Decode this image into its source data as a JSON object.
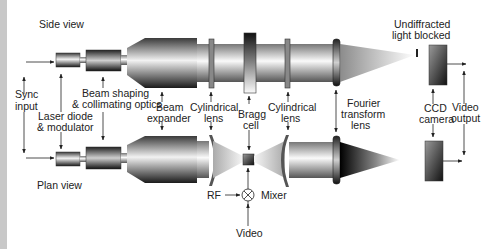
{
  "views": {
    "side": "Side view",
    "plan": "Plan view"
  },
  "labels": {
    "sync_input": [
      "Sync",
      "input"
    ],
    "laser_diode": [
      "Laser diode",
      "& modulator"
    ],
    "beam_shaping": [
      "Beam shaping",
      "& collimating optics"
    ],
    "beam_expander": [
      "Beam",
      "expander"
    ],
    "cyl_lens_1": [
      "Cylindrical",
      "lens"
    ],
    "bragg_cell": [
      "Bragg",
      "cell"
    ],
    "cyl_lens_2": [
      "Cylindrical",
      "lens"
    ],
    "fourier_lens": [
      "Fourier",
      "transform",
      "lens"
    ],
    "undiffracted": [
      "Undiffracted",
      "light blocked"
    ],
    "ccd_camera": [
      "CCD",
      "camera"
    ],
    "video_output": [
      "Video",
      "output"
    ],
    "rf": "RF",
    "mixer": "Mixer",
    "video": "Video"
  },
  "colors": {
    "strip": "#c8c8c8",
    "line": "#222222",
    "text": "#222222"
  }
}
